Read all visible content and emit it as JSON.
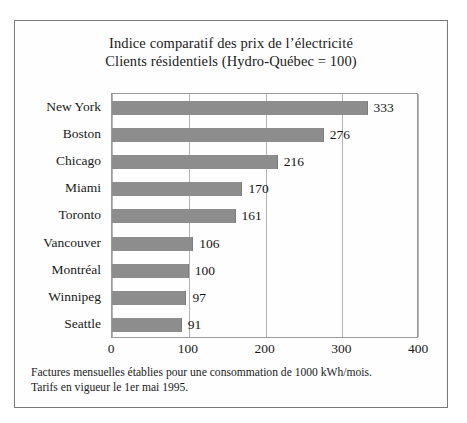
{
  "title": {
    "line1": "Indice comparatif des prix de l’électricité",
    "line2": "Clients résidentiels (Hydro-Québec = 100)"
  },
  "footnote": {
    "line1": "Factures mensuelles établies pour une consommation de 1000 kWh/mois.",
    "line2": "Tarifs en vigueur le 1er mai 1995."
  },
  "colors": {
    "bar": "#8d8d8d",
    "frame": "#7a7a7a",
    "gridline": "#b4b4b4",
    "text": "#1a1a1a"
  },
  "chart_data": {
    "type": "bar",
    "orientation": "horizontal",
    "categories": [
      "New York",
      "Boston",
      "Chicago",
      "Miami",
      "Toronto",
      "Vancouver",
      "Montréal",
      "Winnipeg",
      "Seattle"
    ],
    "values": [
      333,
      276,
      216,
      170,
      161,
      106,
      100,
      97,
      91
    ],
    "value_labels": [
      "333",
      "276",
      "216",
      "170",
      "161",
      "106",
      "100",
      "97",
      "91"
    ],
    "xlabel": "",
    "ylabel": "",
    "xlim": [
      0,
      400
    ],
    "xticks": [
      0,
      100,
      200,
      300,
      400
    ],
    "xtick_labels": [
      "0",
      "100",
      "200",
      "300",
      "400"
    ],
    "grid": true,
    "grid_axis": "x",
    "legend": false
  }
}
